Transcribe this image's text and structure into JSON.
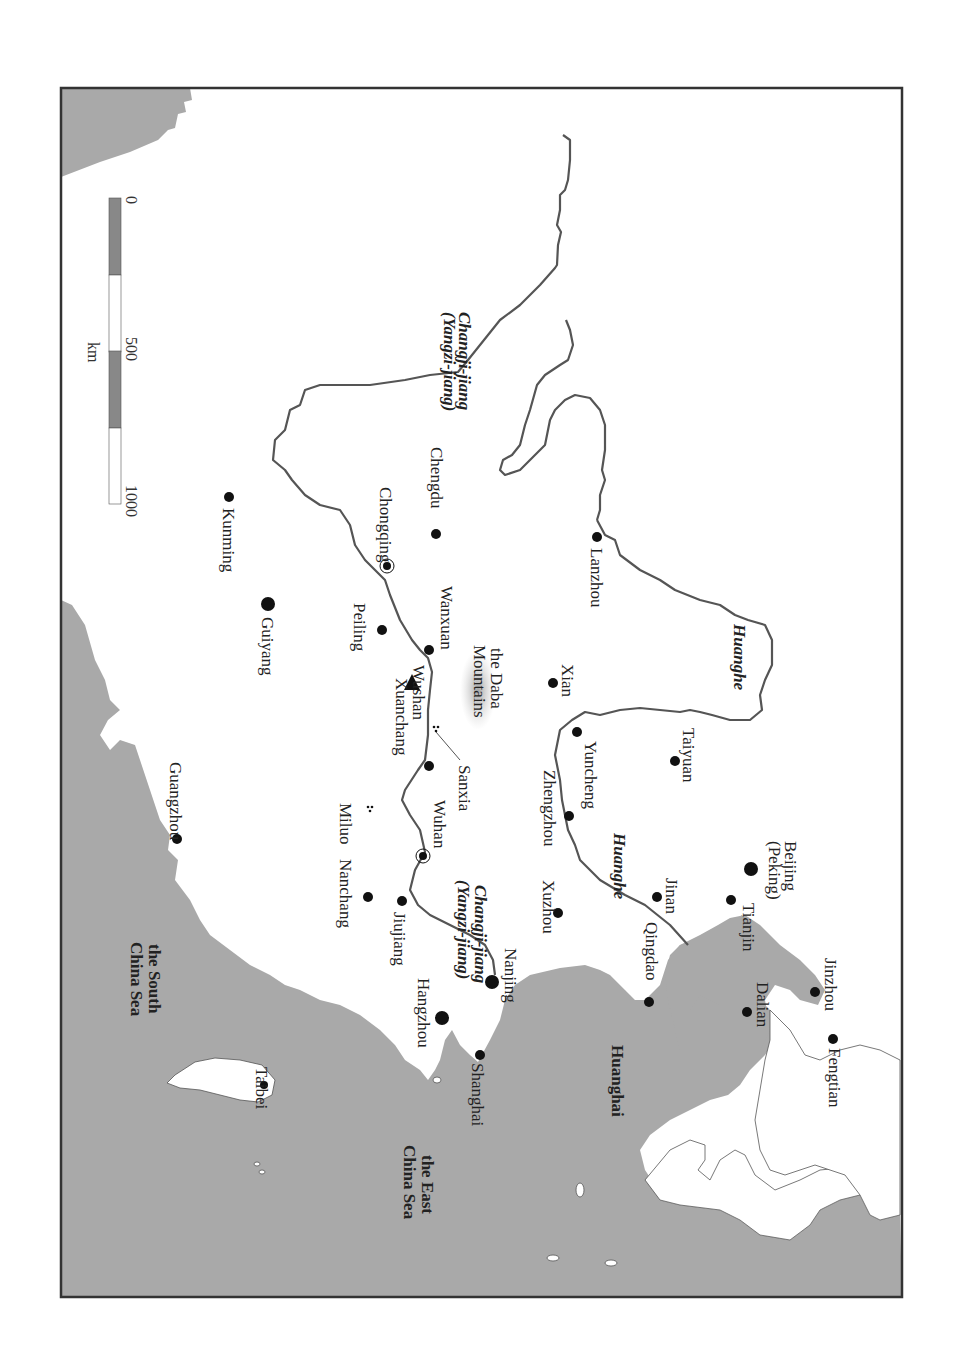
{
  "map": {
    "orientation": "rotated 90 degrees clockwise",
    "colors": {
      "sea": "#a9a9a9",
      "land": "#ffffff",
      "river": "#555555",
      "frame": "#333333",
      "city": "#111111",
      "mountain_shade": "#b8b8b8"
    },
    "scale_bar": {
      "ticks": [
        "0",
        "500",
        "1000"
      ],
      "unit": "km"
    },
    "rivers": [
      {
        "name": "Changji-jiang",
        "alt": "(Yangzi-jiang)"
      },
      {
        "name": "Huanghe"
      }
    ],
    "seas": [
      {
        "name": "Huanghai"
      },
      {
        "name": "the East China Sea",
        "line1": "the East",
        "line2": "China Sea"
      },
      {
        "name": "the South China Sea",
        "line1": "the South",
        "line2": "China Sea"
      }
    ],
    "mountains": {
      "line1": "the Daba",
      "line2": "Mountains"
    },
    "cities": [
      {
        "name": "Lanzhou"
      },
      {
        "name": "Chengdu"
      },
      {
        "name": "Chongqing"
      },
      {
        "name": "Kunming"
      },
      {
        "name": "Guiyang"
      },
      {
        "name": "Peiling"
      },
      {
        "name": "Wanxuan"
      },
      {
        "name": "Wushan"
      },
      {
        "name": "Xuanchang"
      },
      {
        "name": "Sanxia"
      },
      {
        "name": "Xian"
      },
      {
        "name": "Yuncheng"
      },
      {
        "name": "Taiyuan"
      },
      {
        "name": "Zhengzhou"
      },
      {
        "name": "Wuhan"
      },
      {
        "name": "Miluo"
      },
      {
        "name": "Nanchang"
      },
      {
        "name": "Jiujiang"
      },
      {
        "name": "Guangzhou"
      },
      {
        "name": "Xuzhou"
      },
      {
        "name": "Jinan"
      },
      {
        "name": "Beijing",
        "alt": "(Peking)"
      },
      {
        "name": "Tianjin"
      },
      {
        "name": "Qingdao"
      },
      {
        "name": "Nanjing"
      },
      {
        "name": "Hangzhou"
      },
      {
        "name": "Shanghai"
      },
      {
        "name": "Dalian"
      },
      {
        "name": "Jinzhou"
      },
      {
        "name": "Fengtian"
      },
      {
        "name": "Taibei"
      }
    ],
    "river_labels": {
      "changji_upper": "Changji-jiang",
      "yangzi_upper": "(Yangzi-jiang)",
      "changji_lower": "Changji-jiang",
      "yangzi_lower": "(Yangzi-jiang)",
      "huanghe_upper": "Huanghe",
      "huanghe_lower": "Huanghe"
    }
  }
}
